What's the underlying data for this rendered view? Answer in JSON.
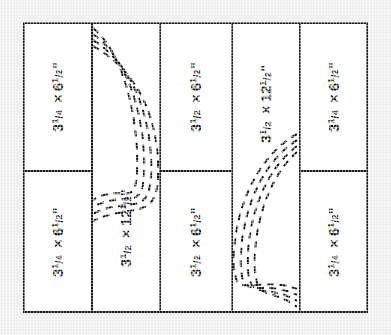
{
  "diagram": {
    "name": "cut-layout-panel-diagram",
    "background_color": "#eeeeee",
    "panel_color": "#ffffff",
    "line_color": "#1a1a1a",
    "arc_style": "dashed",
    "arc_count_per_group": 4,
    "columns": [
      {
        "index": 1,
        "split": true,
        "cells": [
          {
            "position": "top",
            "label": "3¼ × 6½\"",
            "whole": "3",
            "frac_num": "1",
            "frac_den": "4",
            "second_whole": "6",
            "second_num": "1",
            "second_den": "2",
            "unit": "\""
          },
          {
            "position": "bottom",
            "label": "3¼ × 6½\"",
            "whole": "3",
            "frac_num": "1",
            "frac_den": "4",
            "second_whole": "6",
            "second_num": "1",
            "second_den": "2",
            "unit": "\""
          }
        ]
      },
      {
        "index": 2,
        "split": false,
        "has_arcs": true,
        "arc_direction": "bulge-right",
        "cells": [
          {
            "position": "full",
            "label": "3½ × 12½\"",
            "whole": "3",
            "frac_num": "1",
            "frac_den": "2",
            "second_whole": "12",
            "second_num": "1",
            "second_den": "2",
            "unit": "\""
          }
        ]
      },
      {
        "index": 3,
        "split": true,
        "cells": [
          {
            "position": "top",
            "label": "3½ × 6½\"",
            "whole": "3",
            "frac_num": "1",
            "frac_den": "2",
            "second_whole": "6",
            "second_num": "1",
            "second_den": "2",
            "unit": "\""
          },
          {
            "position": "bottom",
            "label": "3½ × 6½\"",
            "whole": "3",
            "frac_num": "1",
            "frac_den": "2",
            "second_whole": "6",
            "second_num": "1",
            "second_den": "2",
            "unit": "\""
          }
        ]
      },
      {
        "index": 4,
        "split": false,
        "has_arcs": true,
        "arc_direction": "bulge-left",
        "cells": [
          {
            "position": "full",
            "label": "3½ × 12½\"",
            "whole": "3",
            "frac_num": "1",
            "frac_den": "2",
            "second_whole": "12",
            "second_num": "1",
            "second_den": "2",
            "unit": "\""
          }
        ]
      },
      {
        "index": 5,
        "split": true,
        "cells": [
          {
            "position": "top",
            "label": "3¼ × 6½\"",
            "whole": "3",
            "frac_num": "1",
            "frac_den": "4",
            "second_whole": "6",
            "second_num": "1",
            "second_den": "2",
            "unit": "\""
          },
          {
            "position": "bottom",
            "label": "3¼ × 6½\"",
            "whole": "3",
            "frac_num": "1",
            "frac_den": "4",
            "second_whole": "6",
            "second_num": "1",
            "second_den": "2",
            "unit": "\""
          }
        ]
      }
    ]
  }
}
